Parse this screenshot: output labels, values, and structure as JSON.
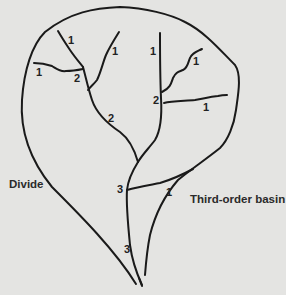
{
  "diagram": {
    "labels": {
      "divide": "Divide",
      "basin": "Third-order basin"
    },
    "stream_orders": [
      {
        "id": "o1-a",
        "value": "1",
        "x": 68,
        "y": 33
      },
      {
        "id": "o1-b",
        "value": "1",
        "x": 112,
        "y": 46
      },
      {
        "id": "o1-c",
        "value": "1",
        "x": 35,
        "y": 66
      },
      {
        "id": "o2-a",
        "value": "2",
        "x": 74,
        "y": 74
      },
      {
        "id": "o1-d",
        "value": "1",
        "x": 150,
        "y": 45
      },
      {
        "id": "o1-e",
        "value": "1",
        "x": 194,
        "y": 56
      },
      {
        "id": "o2-b",
        "value": "2",
        "x": 152,
        "y": 96
      },
      {
        "id": "o1-f",
        "value": "1",
        "x": 203,
        "y": 101
      },
      {
        "id": "o2-c",
        "value": "2",
        "x": 108,
        "y": 113
      },
      {
        "id": "o3-a",
        "value": "3",
        "x": 117,
        "y": 184
      },
      {
        "id": "o1-g",
        "value": "1",
        "x": 165,
        "y": 186
      },
      {
        "id": "o3-b",
        "value": "3",
        "x": 123,
        "y": 243
      }
    ],
    "colors": {
      "background": "#e4e4e2",
      "line": "#1a1a1a",
      "text": "#222222"
    }
  }
}
